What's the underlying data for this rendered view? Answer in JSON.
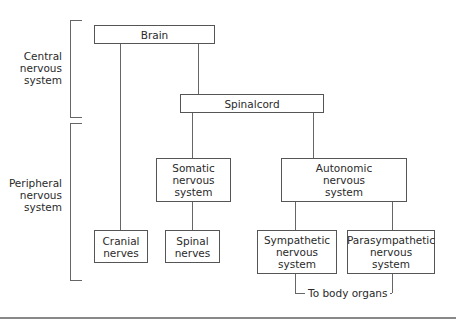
{
  "diagram": {
    "groups": [
      {
        "id": "cns",
        "label": "Central\nnervous\nsystem"
      },
      {
        "id": "pns",
        "label": "Peripheral\nnervous\nsystem"
      }
    ],
    "nodes": {
      "brain": "Brain",
      "spinalcord": "Spinalcord",
      "somatic": "Somatic\nnervous\nsystem",
      "autonomic": "Autonomic\nnervous\nsystem",
      "cranial": "Cranial\nnerves",
      "spinal": "Spinal\nnerves",
      "sympathetic": "Sympathetic\nnervous\nsystem",
      "parasympathetic": "Parasympathetic\nnervous\nsystem"
    },
    "edges": [
      [
        "brain",
        "cranial"
      ],
      [
        "brain",
        "spinalcord"
      ],
      [
        "spinalcord",
        "somatic"
      ],
      [
        "spinalcord",
        "autonomic"
      ],
      [
        "somatic",
        "spinal"
      ],
      [
        "autonomic",
        "sympathetic"
      ],
      [
        "autonomic",
        "parasympathetic"
      ]
    ],
    "output_note": "To body organs"
  }
}
